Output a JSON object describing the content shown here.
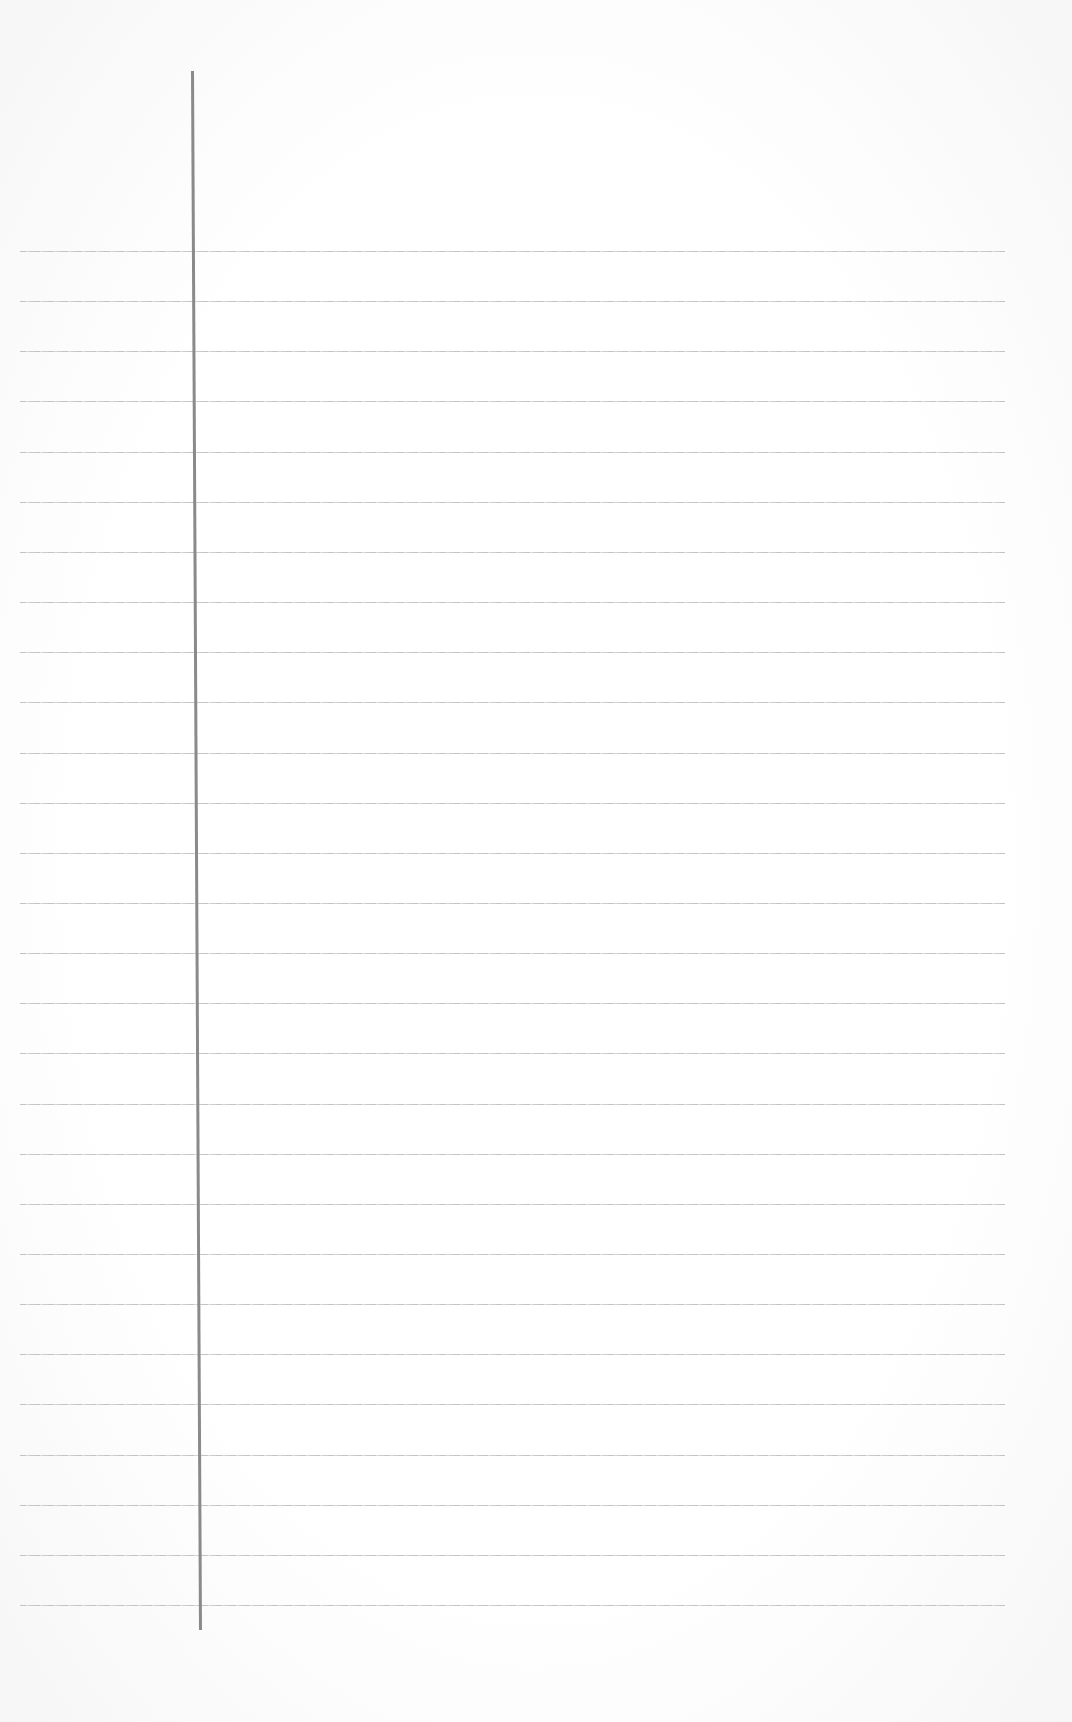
{
  "page": {
    "type": "blank ruled notebook paper",
    "background_color": "#fdfdfd",
    "rule_color": "#c4c4c4",
    "margin_line_color": "#8a8a8a",
    "rule_count": 28,
    "rule_start_y": 251,
    "rule_spacing": 50.15,
    "rule_left": 20,
    "rule_right": 1005,
    "margin_line": {
      "x_top": 191,
      "y_top": 71,
      "x_bottom": 199,
      "y_bottom": 1630
    }
  }
}
